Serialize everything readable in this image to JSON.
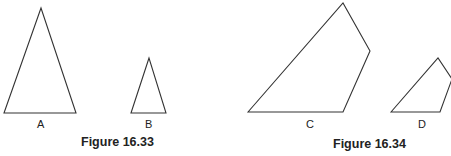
{
  "figures": [
    {
      "caption": "Figure 16.33",
      "shapes": [
        {
          "label": "A",
          "type": "triangle",
          "points": [
            [
              41,
              8
            ],
            [
              4,
              113
            ],
            [
              76,
              113
            ]
          ]
        },
        {
          "label": "B",
          "type": "triangle",
          "points": [
            [
              149,
              58
            ],
            [
              131,
              113
            ],
            [
              166,
              113
            ]
          ]
        }
      ]
    },
    {
      "caption": "Figure 16.34",
      "shapes": [
        {
          "label": "C",
          "type": "quadrilateral",
          "points": [
            [
              248,
              112
            ],
            [
              343,
              3
            ],
            [
              370,
              51
            ],
            [
              343,
              112
            ]
          ]
        },
        {
          "label": "D",
          "type": "quadrilateral",
          "points": [
            [
              391,
              112
            ],
            [
              438,
              58
            ],
            [
              452,
              79
            ],
            [
              440,
              112
            ]
          ]
        }
      ]
    }
  ],
  "style": {
    "stroke": "#333333",
    "background": "#ffffff"
  }
}
